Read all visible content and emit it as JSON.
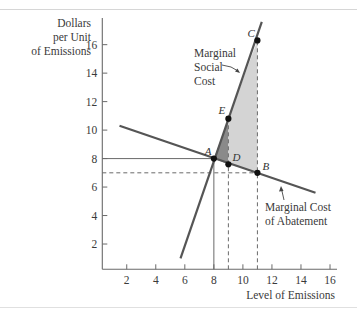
{
  "chart_data": {
    "type": "line",
    "title": "",
    "xlabel": "Level of Emissions",
    "ylabel": "Dollars per Unit of Emissions",
    "ylabel_lines": [
      "Dollars",
      "per Unit",
      "of Emissions"
    ],
    "xlim": [
      0,
      16.5
    ],
    "ylim": [
      0,
      17.5
    ],
    "grid": false,
    "x_ticks": [
      2,
      4,
      6,
      8,
      10,
      12,
      14,
      16
    ],
    "y_ticks": [
      2,
      4,
      6,
      8,
      10,
      12,
      14,
      16
    ],
    "series": [
      {
        "name": "Marginal Social Cost",
        "label_lines": [
          "Marginal",
          "Social",
          "Cost"
        ],
        "points": [
          [
            5.7,
            1.0
          ],
          [
            11.3,
            17.6
          ]
        ]
      },
      {
        "name": "Marginal Cost of Abatement",
        "label_lines": [
          "Marginal Cost",
          "of Abatement"
        ],
        "points": [
          [
            1.5,
            10.3
          ],
          [
            15.0,
            5.6
          ]
        ]
      }
    ],
    "points": [
      {
        "label": "A",
        "x": 8,
        "y": 8
      },
      {
        "label": "E",
        "x": 9,
        "y": 10.8
      },
      {
        "label": "C",
        "x": 11,
        "y": 16.3
      },
      {
        "label": "D",
        "x": 9,
        "y": 7.6
      },
      {
        "label": "B",
        "x": 11,
        "y": 7
      }
    ],
    "reference_lines": [
      {
        "style": "solid",
        "from": [
          0,
          8
        ],
        "to": [
          8,
          8
        ]
      },
      {
        "style": "solid",
        "from": [
          8,
          0
        ],
        "to": [
          8,
          8
        ]
      },
      {
        "style": "dashed",
        "from": [
          0,
          7
        ],
        "to": [
          11,
          7
        ]
      },
      {
        "style": "dashed",
        "from": [
          9,
          0
        ],
        "to": [
          9,
          10.8
        ]
      },
      {
        "style": "dashed",
        "from": [
          11,
          0
        ],
        "to": [
          11,
          16.3
        ]
      }
    ],
    "shaded_regions": [
      {
        "name": "dark-triangle-AED",
        "vertices": [
          "A",
          "E",
          "D"
        ],
        "color": "#8a8a8a"
      },
      {
        "name": "light-region-ECBD",
        "vertices": [
          "E",
          "C",
          "B",
          "D"
        ],
        "color": "#d4d4d4"
      }
    ]
  },
  "colors": {
    "curve": "#555555",
    "axis": "#6a6a6a",
    "dark_shade": "#8a8a8a",
    "light_shade": "#d4d4d4",
    "point": "#111111"
  }
}
